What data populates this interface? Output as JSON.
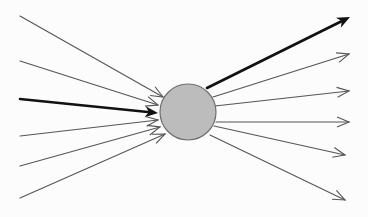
{
  "diagram": {
    "type": "fan-in-fan-out",
    "node": {
      "cx": 188,
      "cy": 112,
      "r": 28,
      "fill": "#bcbcbc",
      "stroke": "#6e6e6e"
    },
    "colors": {
      "thin_line": "#555555",
      "thick_line": "#111111",
      "background": "#fcfcfc"
    },
    "incoming": [
      {
        "x1": 20,
        "y1": 16,
        "x2": 163,
        "y2": 97,
        "thick": false
      },
      {
        "x1": 20,
        "y1": 61,
        "x2": 158,
        "y2": 105,
        "thick": false
      },
      {
        "x1": 20,
        "y1": 99,
        "x2": 158,
        "y2": 113,
        "thick": true
      },
      {
        "x1": 20,
        "y1": 136,
        "x2": 158,
        "y2": 120,
        "thick": false
      },
      {
        "x1": 20,
        "y1": 166,
        "x2": 160,
        "y2": 127,
        "thick": false
      },
      {
        "x1": 20,
        "y1": 198,
        "x2": 165,
        "y2": 134,
        "thick": false
      }
    ],
    "outgoing": [
      {
        "x1": 207,
        "y1": 88,
        "x2": 350,
        "y2": 17,
        "thick": true
      },
      {
        "x1": 213,
        "y1": 97,
        "x2": 349,
        "y2": 54,
        "thick": false
      },
      {
        "x1": 215,
        "y1": 106,
        "x2": 349,
        "y2": 91,
        "thick": false
      },
      {
        "x1": 216,
        "y1": 122,
        "x2": 349,
        "y2": 122,
        "thick": false
      },
      {
        "x1": 214,
        "y1": 126,
        "x2": 345,
        "y2": 155,
        "thick": false
      },
      {
        "x1": 210,
        "y1": 135,
        "x2": 345,
        "y2": 200,
        "thick": false
      }
    ]
  }
}
